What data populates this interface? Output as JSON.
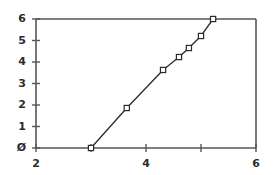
{
  "chart_data": {
    "type": "line",
    "title": "",
    "xlabel": "",
    "ylabel": "",
    "xlim": [
      2,
      6
    ],
    "ylim": [
      0,
      6
    ],
    "grid": false,
    "legend": null,
    "marker": "square-open",
    "line_color": "#2b2b2b",
    "marker_color": "#2b2b2b",
    "axis_color": "#555555",
    "x_ticks": [
      2,
      3,
      4,
      5,
      6
    ],
    "y_ticks": [
      0,
      1,
      2,
      3,
      4,
      5,
      6
    ],
    "x_tick_labels": [
      "2",
      "",
      "4",
      "",
      "6"
    ],
    "y_tick_labels": [
      "Ø",
      "1",
      "2",
      "3",
      "4",
      "5",
      "6"
    ],
    "series": [
      {
        "name": "series-1",
        "x": [
          3.0,
          3.65,
          4.31,
          4.6,
          4.78,
          5.0,
          5.22
        ],
        "y": [
          0.0,
          1.86,
          3.63,
          4.23,
          4.65,
          5.21,
          6.0
        ]
      }
    ]
  }
}
